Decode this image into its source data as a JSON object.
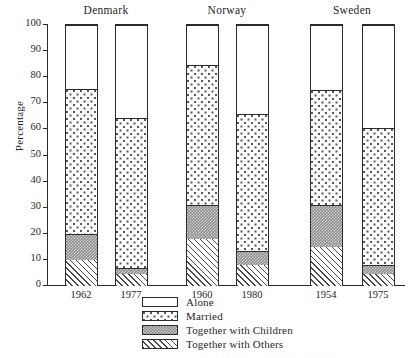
{
  "figure": {
    "y_axis_title": "Percentage",
    "y_ticks": [
      "100",
      "90",
      "80",
      "70",
      "60",
      "50",
      "40",
      "30",
      "20",
      "10",
      "0"
    ],
    "group_titles": [
      "Denmark",
      "Norway",
      "Sweden"
    ],
    "x_tick_labels": [
      "1962",
      "1977",
      "1960",
      "1980",
      "1954",
      "1975"
    ],
    "bleed_text": "· · · · · · · · · · · · · ·"
  },
  "legend": {
    "items": [
      {
        "label": "Alone",
        "swatch": "white-open",
        "color": "#ffffff"
      },
      {
        "label": "Married",
        "swatch": "sparse-dots",
        "color": "#fdfdfd"
      },
      {
        "label": "Together with Children",
        "swatch": "dark-stipple",
        "color": "#8f8f8f"
      },
      {
        "label": "Together with Others",
        "swatch": "diagonal-hatch",
        "color": "#ffffff"
      }
    ]
  },
  "chart_data": {
    "type": "bar",
    "subtype": "stacked-vertical-100",
    "title": "",
    "xlabel": "",
    "ylabel": "Percentage",
    "ylim": [
      0,
      100
    ],
    "ytick_step": 10,
    "grid": false,
    "legend_position": "bottom-center",
    "groups": [
      "Denmark",
      "Norway",
      "Sweden"
    ],
    "categories": [
      "1962",
      "1977",
      "1960",
      "1980",
      "1954",
      "1975"
    ],
    "group_of_category": [
      "Denmark",
      "Denmark",
      "Norway",
      "Norway",
      "Sweden",
      "Sweden"
    ],
    "stack_order_bottom_to_top": [
      "Together with Others",
      "Together with Children",
      "Married",
      "Alone"
    ],
    "series": [
      {
        "name": "Together with Others",
        "values": [
          10.0,
          4.5,
          18.0,
          8.0,
          15.0,
          4.5
        ]
      },
      {
        "name": "Together with Children",
        "values": [
          10.0,
          2.5,
          13.0,
          5.5,
          16.0,
          3.5
        ]
      },
      {
        "name": "Married",
        "values": [
          55.5,
          57.5,
          53.5,
          52.5,
          44.0,
          52.5
        ]
      },
      {
        "name": "Alone",
        "values": [
          24.5,
          35.5,
          15.5,
          34.0,
          25.0,
          39.5
        ]
      }
    ],
    "cumulative_tops": {
      "Together with Others": [
        10.0,
        4.5,
        18.0,
        8.0,
        15.0,
        4.5
      ],
      "Together with Children": [
        20.0,
        7.0,
        31.0,
        13.5,
        31.0,
        8.0
      ],
      "Married": [
        75.5,
        64.5,
        84.5,
        66.0,
        75.0,
        60.5
      ],
      "Alone": [
        100,
        100,
        100,
        100,
        100,
        100
      ]
    }
  }
}
